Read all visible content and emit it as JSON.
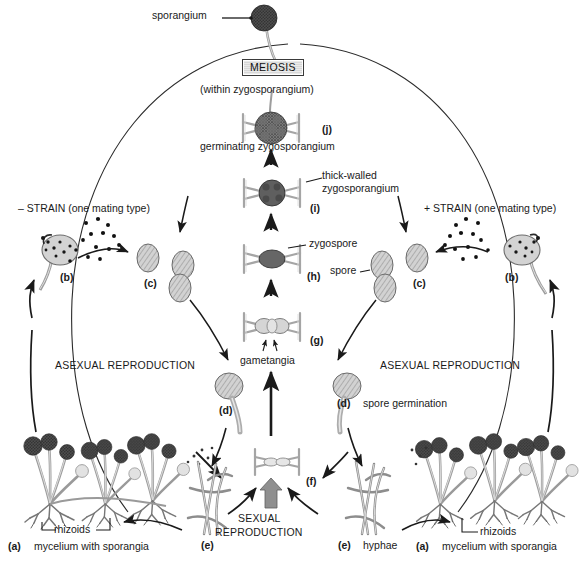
{
  "diagram": {
    "colors": {
      "ink": "#1a1a1a",
      "line": "#333333",
      "spore_fill": "#c9c9c9",
      "zygospore_fill": "#6e6e6e",
      "sporangium_fill": "#5a5a5a",
      "hypha_fill": "#d9d9d9",
      "meiosis_box": "#e0e0e0",
      "background": "#ffffff"
    }
  },
  "labels": {
    "sporangium": "sporangium",
    "meiosis": "MEIOSIS",
    "meiosis_sub": "(within zygosporangium)",
    "germinating_zygosporangium": "germinating zygosporangium",
    "thick_walled_line1": "thick-walled",
    "thick_walled_line2": "zygosporangium",
    "zygospore": "zygospore",
    "spore": "spore",
    "gametangia": "gametangia",
    "minus_strain": "– STRAIN (one mating type)",
    "plus_strain": "+ STRAIN (one mating type)",
    "asexual_left": "ASEXUAL REPRODUCTION",
    "asexual_right": "ASEXUAL REPRODUCTION",
    "sexual_line1": "SEXUAL",
    "sexual_line2": "REPRODUCTION",
    "spore_germination": "spore germination",
    "hyphae": "hyphae",
    "rhizoids_left": "rhizoids",
    "rhizoids_right": "rhizoids",
    "mycelium_left": "mycelium with sporangia",
    "mycelium_right": "mycelium with sporangia"
  },
  "stage_keys": {
    "a_left": "(a)",
    "a_right": "(a)",
    "b_left": "(b)",
    "b_right": "(b)",
    "c_left": "(c)",
    "c_right": "(c)",
    "d_left": "(d)",
    "d_right": "(d)",
    "e_left": "(e)",
    "e_right": "(e)",
    "f": "(f)",
    "g": "(g)",
    "h": "(h)",
    "i": "(i)",
    "j": "(j)"
  },
  "stages": [
    {
      "key": "(a)",
      "name": "mycelium with sporangia",
      "side": "left"
    },
    {
      "key": "(b)",
      "name": "sporangium releasing spores",
      "side": "left"
    },
    {
      "key": "(c)",
      "name": "spores",
      "side": "left"
    },
    {
      "key": "(d)",
      "name": "spore germination",
      "side": "left"
    },
    {
      "key": "(e)",
      "name": "hyphae",
      "side": "left"
    },
    {
      "key": "(f)",
      "name": "hyphae fusion",
      "side": "center"
    },
    {
      "key": "(g)",
      "name": "gametangia",
      "side": "center"
    },
    {
      "key": "(h)",
      "name": "zygospore",
      "side": "center"
    },
    {
      "key": "(i)",
      "name": "thick-walled zygosporangium",
      "side": "center"
    },
    {
      "key": "(j)",
      "name": "germinating zygosporangium",
      "side": "center"
    },
    {
      "key": "(a)",
      "name": "mycelium with sporangia",
      "side": "right"
    },
    {
      "key": "(b)",
      "name": "sporangium releasing spores",
      "side": "right"
    },
    {
      "key": "(c)",
      "name": "spores",
      "side": "right"
    },
    {
      "key": "(d)",
      "name": "spore germination",
      "side": "right"
    },
    {
      "key": "(e)",
      "name": "hyphae",
      "side": "right"
    }
  ]
}
